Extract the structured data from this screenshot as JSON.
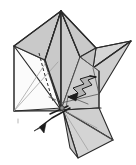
{
  "figure": {
    "title": "Origami fold step diagram",
    "kind": "line-art illustration",
    "canvas": {
      "width": 136,
      "height": 165,
      "background": "#ffffff"
    }
  },
  "palette": {
    "paper_fill": "#c9c9c9",
    "paper_fill_light": "#d6d6d6",
    "paper_fill_lighter": "#dedede",
    "paper_fill_white": "#fbfbfb",
    "paper_fill_mid": "#bfbfbf",
    "outline": "#2b2b2b",
    "outline_soft": "#555555",
    "outline_pale": "#9a9a9a",
    "arrow": "#1c1c1c",
    "background": "#ffffff"
  },
  "annotations": {
    "reverse_fold_arrow": "zigzag-arrow",
    "valley_fold_arrow": "down-left-arrow",
    "fold_guide": "dashed-fold-line"
  },
  "geometry": {
    "apex": "61,11",
    "right_wing_tip": "131,41",
    "left_corner": "14,46",
    "bottom_left_corner": "14,111",
    "bottom_flap_tip": "113,140",
    "bottom_flap_lower": "78,158",
    "hub": "61,110"
  }
}
